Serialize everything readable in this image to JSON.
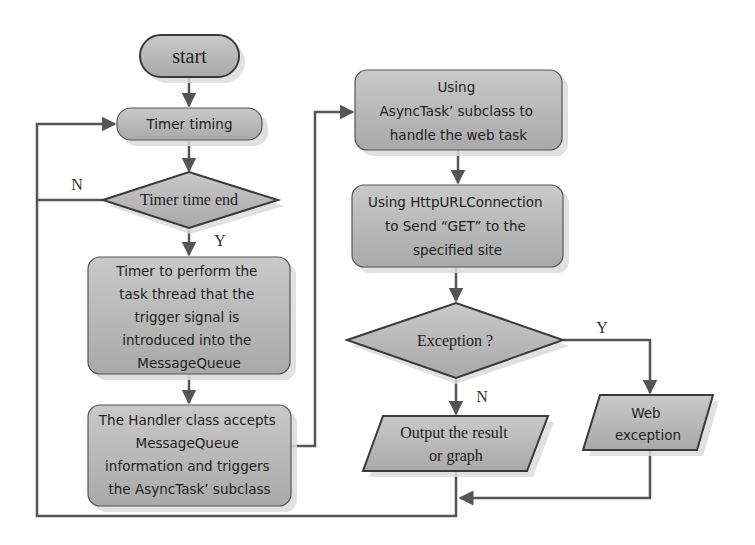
{
  "diagram": {
    "type": "flowchart",
    "colors": {
      "fill": "#bdbdbd",
      "stroke": "#444444",
      "shadow": "#d9d9d9",
      "connector": "#555555",
      "background": "#ffffff"
    },
    "nodes": {
      "start": {
        "shape": "terminator",
        "lines": [
          "start"
        ]
      },
      "timer_timing": {
        "shape": "rounded-process",
        "lines": [
          "Timer timing"
        ]
      },
      "timer_end": {
        "shape": "decision",
        "lines": [
          "Timer time end"
        ]
      },
      "timer_task": {
        "shape": "process",
        "lines": [
          "Timer to perform the",
          "task thread that the",
          "trigger signal is",
          "introduced into the",
          "MessageQueue"
        ]
      },
      "handler": {
        "shape": "process",
        "lines": [
          "The Handler class accepts",
          "MessageQueue",
          "information and triggers",
          "the AsyncTask’  subclass"
        ]
      },
      "asynctask": {
        "shape": "process",
        "lines": [
          "Using",
          "AsyncTask’  subclass to",
          "handle the web task"
        ]
      },
      "http_get": {
        "shape": "process",
        "lines": [
          "Using HttpURLConnection",
          "to Send “GET” to the",
          "specified site"
        ]
      },
      "exception": {
        "shape": "decision",
        "lines": [
          "Exception ?"
        ]
      },
      "output": {
        "shape": "data",
        "lines": [
          "Output the result",
          "or graph"
        ]
      },
      "web_exception": {
        "shape": "data",
        "lines": [
          "Web",
          "exception"
        ]
      }
    },
    "edges": [
      {
        "from": "start",
        "to": "timer_timing",
        "label": ""
      },
      {
        "from": "timer_timing",
        "to": "timer_end",
        "label": ""
      },
      {
        "from": "timer_end",
        "to": "timer_task",
        "label": "Y"
      },
      {
        "from": "timer_end",
        "to": "timer_timing",
        "label": "N"
      },
      {
        "from": "timer_task",
        "to": "handler",
        "label": ""
      },
      {
        "from": "handler",
        "to": "asynctask",
        "label": ""
      },
      {
        "from": "asynctask",
        "to": "http_get",
        "label": ""
      },
      {
        "from": "http_get",
        "to": "exception",
        "label": ""
      },
      {
        "from": "exception",
        "to": "output",
        "label": "N"
      },
      {
        "from": "exception",
        "to": "web_exception",
        "label": "Y"
      },
      {
        "from": "web_exception",
        "to": "output_join",
        "label": ""
      },
      {
        "from": "output",
        "to": "timer_timing",
        "label": ""
      }
    ],
    "labels": {
      "timer_end_no": "N",
      "timer_end_yes": "Y",
      "exception_yes": "Y",
      "exception_no": "N"
    }
  }
}
